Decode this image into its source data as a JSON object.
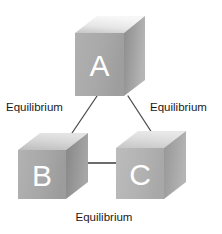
{
  "diagram": {
    "background_color": "#ffffff",
    "nodes": [
      {
        "id": "A",
        "label": "A",
        "position": "top-center",
        "front_face_color": "#a8a8a8",
        "top_face_color": "#ededed",
        "side_face_color": "#8f8f8f",
        "letter_color": "#ffffff"
      },
      {
        "id": "B",
        "label": "B",
        "position": "bottom-left",
        "front_face_color": "#a8a8a8",
        "top_face_color": "#c9c9c9",
        "side_face_color": "#8a8a8a",
        "letter_color": "#ffffff"
      },
      {
        "id": "C",
        "label": "C",
        "position": "bottom-right",
        "front_face_color": "#b4b4b4",
        "top_face_color": "#d2d2d2",
        "side_face_color": "#9a9a9a",
        "letter_color": "#ffffff"
      }
    ],
    "connections": [
      {
        "id": "a-b",
        "from": "A",
        "to": "B",
        "label": "Equilibrium",
        "label_position": "left",
        "line_color": "#4d4d4d"
      },
      {
        "id": "a-c",
        "from": "A",
        "to": "C",
        "label": "Equilibrium",
        "label_position": "right",
        "line_color": "#4d4d4d"
      },
      {
        "id": "b-c",
        "from": "B",
        "to": "C",
        "label": "Equilibrium",
        "label_position": "bottom",
        "line_color": "#3d3d3d"
      }
    ]
  }
}
